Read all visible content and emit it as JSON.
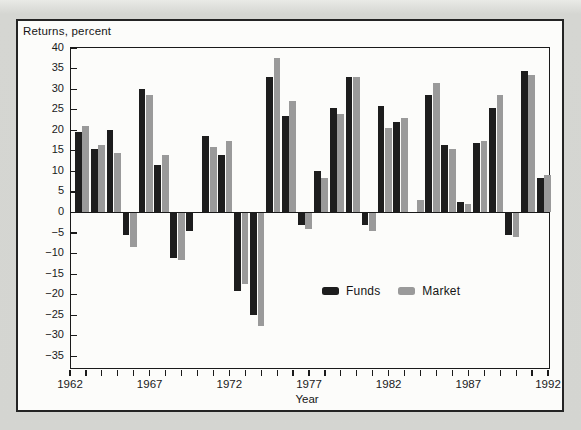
{
  "page": {
    "background": "#d4d5d1",
    "panel_background": "#fcfcfa",
    "line_color": "#1a1a1a"
  },
  "chart_data": {
    "type": "bar",
    "title": "Returns, percent",
    "xlabel": "Year",
    "ylabel": "Returns, percent",
    "ylim": [
      -35,
      40
    ],
    "ytick_step": 5,
    "x_axis_range": [
      1962,
      1992
    ],
    "x_major_tick_labels": [
      "1962",
      "1967",
      "1972",
      "1977",
      "1982",
      "1987",
      "1992"
    ],
    "x_minor_ticks_every_year": true,
    "grid": false,
    "legend": {
      "position": "inside-bottom-center",
      "entries": [
        {
          "label": "Funds",
          "color": "#1d1d1d"
        },
        {
          "label": "Market",
          "color": "#9a9a9a"
        }
      ]
    },
    "categories": [
      1963,
      1964,
      1965,
      1966,
      1967,
      1968,
      1969,
      1970,
      1971,
      1972,
      1973,
      1974,
      1975,
      1976,
      1977,
      1978,
      1979,
      1980,
      1981,
      1982,
      1983,
      1984,
      1985,
      1986,
      1987,
      1988,
      1989,
      1990,
      1991,
      1992
    ],
    "series": [
      {
        "name": "Funds",
        "color": "#1d1d1d",
        "values": [
          19.5,
          15.5,
          20,
          -5.5,
          30,
          11.5,
          -11,
          -4.5,
          18.5,
          14,
          -19,
          -25,
          33,
          23.5,
          -3,
          10,
          25.5,
          33,
          -3,
          26,
          22,
          0,
          28.5,
          16.5,
          2.5,
          17,
          25.5,
          -5.5,
          34.5,
          8.5
        ]
      },
      {
        "name": "Market",
        "color": "#9a9a9a",
        "values": [
          21,
          16.5,
          14.5,
          -8.5,
          28.5,
          14,
          -11.5,
          0,
          16,
          17.5,
          -17.5,
          -27.5,
          37.5,
          27,
          -4,
          8.5,
          24,
          33,
          -4.5,
          20.5,
          23,
          3,
          31.5,
          15.5,
          2,
          17.5,
          28.5,
          -6,
          33.5,
          9
        ]
      }
    ]
  }
}
